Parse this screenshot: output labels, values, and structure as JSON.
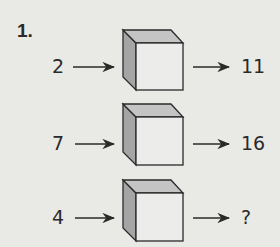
{
  "problem": {
    "number": "1.",
    "rows": [
      {
        "input": "2",
        "output": "11"
      },
      {
        "input": "7",
        "output": "16"
      },
      {
        "input": "4",
        "output": "?"
      }
    ]
  },
  "colors": {
    "background": "#e9e9e6",
    "stroke": "#2a2a2a",
    "side_face": "#a5a5a5",
    "top_face": "#c4c4c4",
    "front_face": "#ececea"
  }
}
